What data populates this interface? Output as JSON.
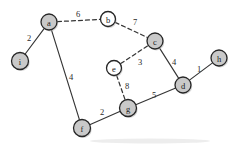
{
  "diagram": {
    "canvas": {
      "width": 236,
      "height": 145,
      "background": "#ffffff"
    },
    "style": {
      "node_fill_visited": "#c9c9c9",
      "node_fill_unvisited": "#ffffff",
      "node_stroke": "#262626",
      "edge_stroke": "#353535",
      "label_color": "#1a1a1a"
    },
    "nodes": [
      {
        "id": "a",
        "label": "a",
        "x": 49,
        "y": 22,
        "r": 8,
        "fill": "filled"
      },
      {
        "id": "b",
        "label": "b",
        "x": 108,
        "y": 19,
        "r": 7.5,
        "fill": "hollow"
      },
      {
        "id": "c",
        "label": "c",
        "x": 155,
        "y": 41,
        "r": 8,
        "fill": "filled"
      },
      {
        "id": "d",
        "label": "d",
        "x": 183,
        "y": 85,
        "r": 8,
        "fill": "filled"
      },
      {
        "id": "e",
        "label": "e",
        "x": 114,
        "y": 68,
        "r": 7.5,
        "fill": "hollow"
      },
      {
        "id": "f",
        "label": "f",
        "x": 82,
        "y": 128,
        "r": 8.5,
        "fill": "filled"
      },
      {
        "id": "g",
        "label": "g",
        "x": 128,
        "y": 108,
        "r": 8.5,
        "fill": "filled"
      },
      {
        "id": "h",
        "label": "h",
        "x": 219,
        "y": 58,
        "r": 8,
        "fill": "filled"
      },
      {
        "id": "i",
        "label": "i",
        "x": 20,
        "y": 61,
        "r": 8.5,
        "fill": "filled"
      }
    ],
    "edges": [
      {
        "from": "i",
        "to": "a",
        "weight": "2",
        "style": "solid",
        "label_x": 29,
        "label_y": 38
      },
      {
        "from": "a",
        "to": "b",
        "weight": "6",
        "style": "dashed",
        "label_x": 78,
        "label_y": 14
      },
      {
        "from": "b",
        "to": "c",
        "weight": "7",
        "style": "dashed",
        "label_x": 135,
        "label_y": 22
      },
      {
        "from": "e",
        "to": "c",
        "weight": "3",
        "style": "dashed",
        "label_x": 140,
        "label_y": 62
      },
      {
        "from": "c",
        "to": "d",
        "weight": "4",
        "style": "solid",
        "label_x": 174,
        "label_y": 62
      },
      {
        "from": "d",
        "to": "h",
        "weight": "1",
        "style": "solid",
        "label_x": 199,
        "label_y": 69
      },
      {
        "from": "a",
        "to": "f",
        "weight": "4",
        "style": "solid",
        "label_x": 71,
        "label_y": 77
      },
      {
        "from": "f",
        "to": "g",
        "weight": "2",
        "style": "solid",
        "label_x": 102,
        "label_y": 112
      },
      {
        "from": "g",
        "to": "d",
        "weight": "5",
        "style": "solid",
        "label_x": 154,
        "label_y": 95
      },
      {
        "from": "e",
        "to": "g",
        "weight": "8",
        "style": "dashed",
        "label_x": 127,
        "label_y": 86
      }
    ]
  }
}
